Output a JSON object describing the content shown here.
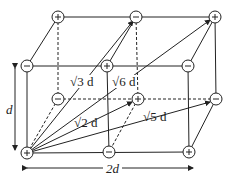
{
  "diagram": {
    "charges": [
      {
        "id": "tb1",
        "sign": "+",
        "x": 58,
        "y": 17
      },
      {
        "id": "tb2",
        "sign": "−",
        "x": 136,
        "y": 17
      },
      {
        "id": "tb3",
        "sign": "+",
        "x": 215,
        "y": 17
      },
      {
        "id": "tf1",
        "sign": "−",
        "x": 27,
        "y": 66
      },
      {
        "id": "tf2",
        "sign": "+",
        "x": 107,
        "y": 66
      },
      {
        "id": "tf3",
        "sign": "−",
        "x": 188,
        "y": 66
      },
      {
        "id": "bb1",
        "sign": "−",
        "x": 58,
        "y": 99
      },
      {
        "id": "bb2",
        "sign": "+",
        "x": 138,
        "y": 99
      },
      {
        "id": "bb3",
        "sign": "−",
        "x": 216,
        "y": 99
      },
      {
        "id": "bf1",
        "sign": "+",
        "x": 27,
        "y": 153
      },
      {
        "id": "bf2",
        "sign": "−",
        "x": 109,
        "y": 152
      },
      {
        "id": "bf3",
        "sign": "+",
        "x": 189,
        "y": 152
      }
    ],
    "labels": {
      "height": "d",
      "width": "2d",
      "dist_sqrt3": "√3 d",
      "dist_sqrt6": "√6 d",
      "dist_sqrt2": "√2 d",
      "dist_sqrt5": "√5 d"
    }
  }
}
